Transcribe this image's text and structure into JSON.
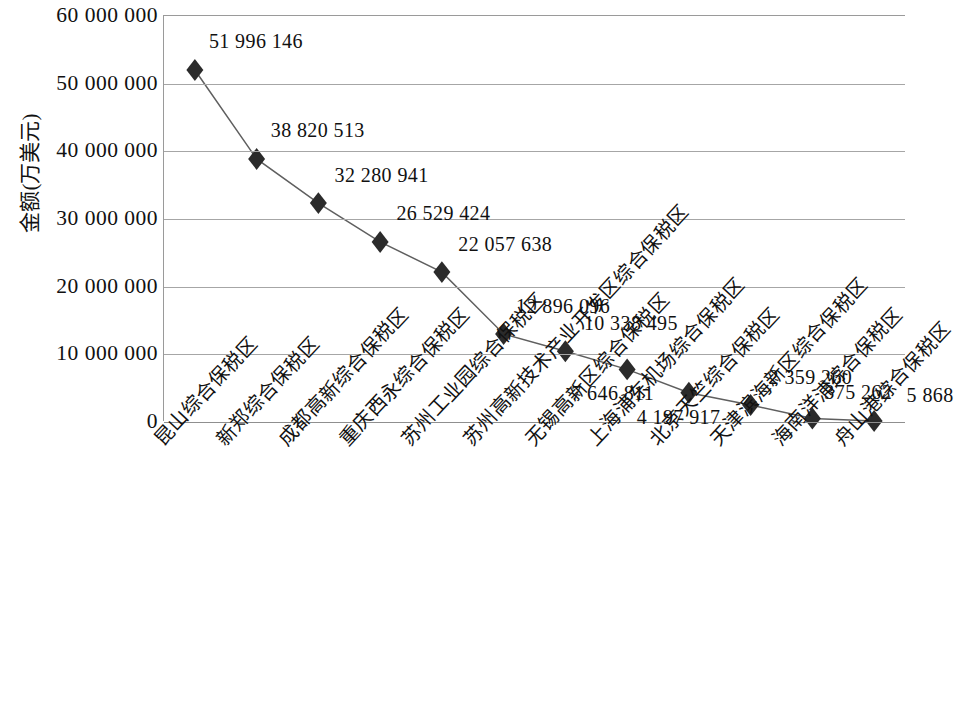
{
  "chart_data": {
    "type": "line",
    "title": "",
    "xlabel": "",
    "ylabel": "金额(万美元)",
    "ylim": [
      0,
      60000000
    ],
    "grid": true,
    "legend": "none",
    "marker": "diamond",
    "y_ticks": [
      {
        "value": 60000000,
        "label": "60 000 000"
      },
      {
        "value": 50000000,
        "label": "50 000 000"
      },
      {
        "value": 40000000,
        "label": "40 000 000"
      },
      {
        "value": 30000000,
        "label": "30 000 000"
      },
      {
        "value": 20000000,
        "label": "20 000 000"
      },
      {
        "value": 10000000,
        "label": "10 000 000"
      },
      {
        "value": 0,
        "label": "0"
      }
    ],
    "categories": [
      "昆山综合保税区",
      "新郑综合保税区",
      "成都高新综合保税区",
      "重庆西永综合保税区",
      "苏州工业园综合保税区",
      "苏州高新技术产业开发区综合保税区",
      "无锡高新区综合保税区",
      "上海浦东机场综合保税区",
      "北京天竺综合保税区",
      "天津滨海新区综合保税区",
      "海南洋浦综合保税区",
      "舟山港综合保税区"
    ],
    "values": [
      51996146,
      38820513,
      32280941,
      26529424,
      22057638,
      12896096,
      10338495,
      7646811,
      4197917,
      2359260,
      375262,
      5868
    ],
    "point_labels": [
      "51 996 146",
      "38 820 513",
      "32 280 941",
      "26 529 424",
      "22 057 638",
      "12 896 096",
      "10 338 495",
      "7 646 811",
      "4 197 917",
      "2 359 260",
      "375 262",
      "5 868"
    ],
    "colors": {
      "line": "#5f5f5f",
      "marker": "#2b2b2b",
      "grid": "#a6a6a6",
      "axis": "#8f8f8f",
      "text": "#111111",
      "background": "#ffffff"
    }
  }
}
